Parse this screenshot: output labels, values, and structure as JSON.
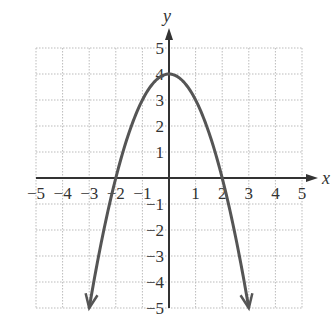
{
  "chart_data": {
    "type": "line",
    "title": "",
    "xlabel": "x",
    "ylabel": "y",
    "xlim": [
      -5,
      5
    ],
    "ylim": [
      -5,
      5
    ],
    "grid": true,
    "x_ticks": [
      "−5",
      "−4",
      "−3",
      "−2",
      "−1",
      "1",
      "2",
      "3",
      "4",
      "5"
    ],
    "y_ticks": [
      "5",
      "4",
      "3",
      "2",
      "1",
      "−1",
      "−2",
      "−3",
      "−4",
      "−5"
    ],
    "series": [
      {
        "name": "y = 4 − x²",
        "x": [
          -3,
          -2,
          -1,
          0,
          1,
          2,
          3
        ],
        "y": [
          -5,
          0,
          3,
          4,
          3,
          0,
          -5
        ],
        "arrows_at_ends": true,
        "color": "#555555"
      }
    ],
    "annotations": []
  },
  "colors": {
    "curve": "#555555",
    "axis": "#333333",
    "grid": "#bbbbbb"
  }
}
